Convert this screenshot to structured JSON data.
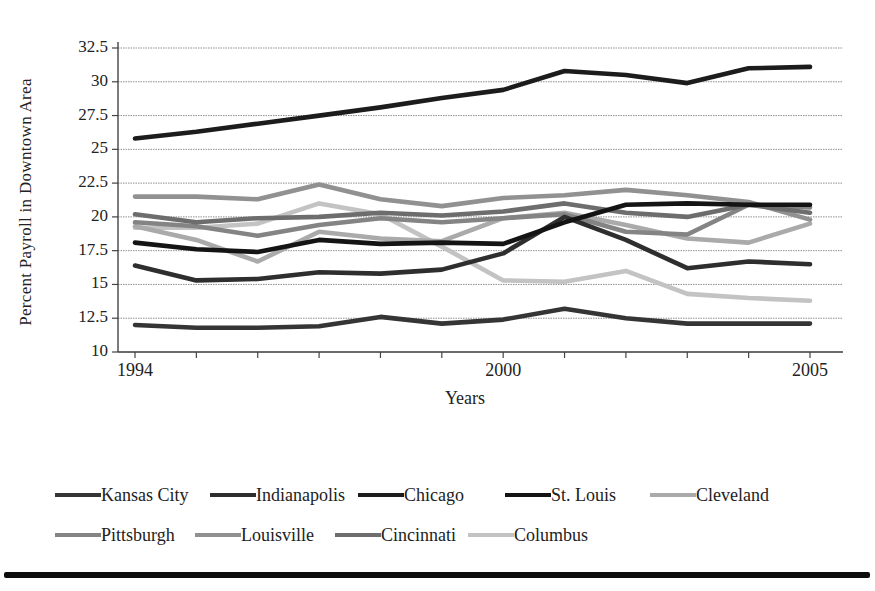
{
  "chart_data": {
    "type": "line",
    "title": "",
    "xlabel": "Years",
    "ylabel": "Percent Payroll in Downtown Area",
    "x": [
      1994,
      1995,
      1996,
      1997,
      1998,
      1999,
      2000,
      2001,
      2002,
      2003,
      2004,
      2005
    ],
    "xlim": [
      1994,
      2005
    ],
    "ylim": [
      10,
      32.5
    ],
    "grid": "horizontal",
    "legend_position": "below-plot",
    "y_tick_values": [
      10,
      12.5,
      15,
      17.5,
      20,
      22.5,
      25,
      27.5,
      30,
      32.5
    ],
    "y_tick_labels": [
      "10",
      "12.5",
      "15",
      "17.5",
      "20",
      "22.5",
      "25",
      "27.5",
      "30",
      "32.5"
    ],
    "x_tick_values": [
      1994,
      2000,
      2005
    ],
    "x_tick_labels": [
      "1994",
      "2000",
      "2005"
    ],
    "series": [
      {
        "name": "Columbus",
        "color": "#c3c3c3",
        "values": [
          19.2,
          19.2,
          19.5,
          21.0,
          20.2,
          17.8,
          15.3,
          15.2,
          16.0,
          14.3,
          14.0,
          13.8
        ]
      },
      {
        "name": "Cleveland",
        "color": "#aaaaaa",
        "values": [
          19.3,
          18.3,
          16.7,
          18.9,
          18.4,
          18.2,
          19.9,
          20.3,
          19.4,
          18.4,
          18.1,
          19.5
        ]
      },
      {
        "name": "Louisville",
        "color": "#919191",
        "values": [
          21.5,
          21.5,
          21.3,
          22.4,
          21.3,
          20.8,
          21.4,
          21.6,
          22.0,
          21.6,
          21.1,
          19.8
        ]
      },
      {
        "name": "Pittsburgh",
        "color": "#848484",
        "values": [
          19.6,
          19.3,
          18.6,
          19.4,
          19.9,
          19.6,
          19.9,
          20.2,
          18.9,
          18.7,
          20.9,
          20.7
        ]
      },
      {
        "name": "Cincinnati",
        "color": "#6d6d6d",
        "values": [
          20.2,
          19.6,
          19.9,
          20.0,
          20.3,
          20.1,
          20.4,
          21.0,
          20.3,
          20.0,
          20.9,
          20.3
        ]
      },
      {
        "name": "Indianapolis",
        "color": "#2e2e2e",
        "values": [
          16.4,
          15.3,
          15.4,
          15.9,
          15.8,
          16.1,
          17.3,
          20.0,
          18.3,
          16.2,
          16.7,
          16.5
        ]
      },
      {
        "name": "Kansas City",
        "color": "#353535",
        "values": [
          12.0,
          11.8,
          11.8,
          11.9,
          12.6,
          12.1,
          12.4,
          13.2,
          12.5,
          12.1,
          12.1,
          12.1
        ]
      },
      {
        "name": "St. Louis",
        "color": "#141414",
        "values": [
          18.1,
          17.6,
          17.4,
          18.3,
          18.0,
          18.1,
          18.0,
          19.6,
          20.9,
          21.0,
          20.9,
          20.9
        ]
      },
      {
        "name": "Chicago",
        "color": "#1c1c1c",
        "values": [
          25.8,
          26.3,
          26.9,
          27.5,
          28.1,
          28.8,
          29.4,
          30.8,
          30.5,
          29.9,
          31.0,
          31.1
        ]
      }
    ],
    "legend_rows": [
      [
        "Kansas City",
        "Indianapolis",
        "Chicago",
        "St. Louis",
        "Cleveland"
      ],
      [
        "Pittsburgh",
        "Louisville",
        "Cincinnati",
        "Columbus"
      ]
    ]
  }
}
